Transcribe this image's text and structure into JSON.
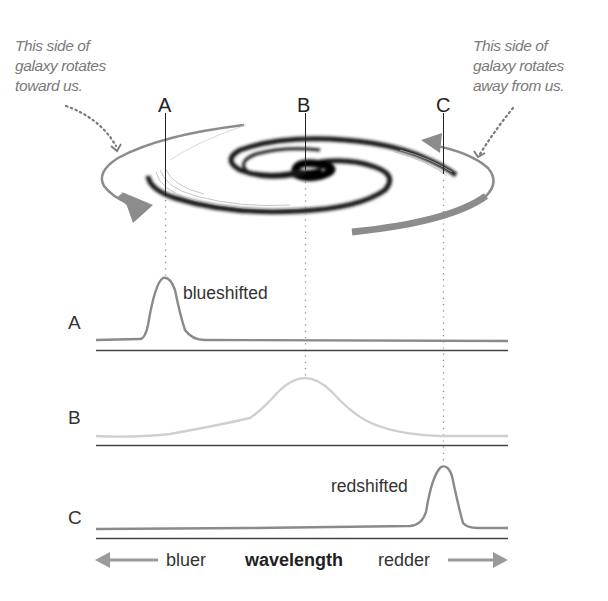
{
  "annotations": {
    "toward": {
      "lines": [
        "This side of",
        "galaxy rotates",
        "toward us."
      ]
    },
    "away": {
      "lines": [
        "This side of",
        "galaxy rotates",
        "away from us."
      ]
    }
  },
  "points": [
    {
      "label": "A",
      "x": 165
    },
    {
      "label": "B",
      "x": 305
    },
    {
      "label": "C",
      "x": 443
    }
  ],
  "spectra": [
    {
      "row_label": "A",
      "shift_label": "blueshifted",
      "peak_x": 165,
      "line_color": "#8a8a8a"
    },
    {
      "row_label": "B",
      "shift_label": "",
      "peak_x": 305,
      "line_color": "#cfcfcf"
    },
    {
      "row_label": "C",
      "shift_label": "redshifted",
      "peak_x": 443,
      "line_color": "#8a8a8a"
    }
  ],
  "axis": {
    "left_label": "bluer",
    "center_label": "wavelength",
    "right_label": "redder",
    "left_arrow_icon": "arrow-left-icon",
    "right_arrow_icon": "arrow-right-icon"
  },
  "colors": {
    "annotation_text": "#7a7a7a",
    "rotation_arrow": "#8c8c8c",
    "spiral_arm": "#111111",
    "axis_line": "#444444"
  }
}
